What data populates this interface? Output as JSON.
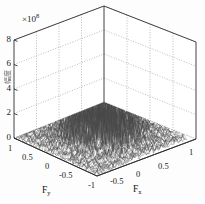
{
  "figure": {
    "kind": "3d-mesh-surface-plot",
    "background_color": "#fdfdfd",
    "mesh_color": "#3a3a3a",
    "grid_color": "#9a9a9a",
    "axis_color": "#2a2a2a",
    "exponent_prefix": "×10",
    "exponent_power": "8",
    "z_axis_title": "幅度"
  },
  "chart_data": {
    "type": "surface",
    "title": "",
    "xlabel": "F",
    "xlabel_sub": "x",
    "ylabel": "F",
    "ylabel_sub": "y",
    "zlabel": "",
    "xlim": [
      -1,
      1
    ],
    "ylim": [
      -1,
      1
    ],
    "zlim": [
      0,
      8
    ],
    "z_scale_multiplier": "×10^8",
    "grid": true,
    "legend": "none",
    "xticks": [
      -1,
      -0.5,
      0,
      0.5,
      1
    ],
    "xticklabels": [
      "-1",
      "-0.5",
      "0",
      "0.5",
      "1"
    ],
    "yticks": [
      -1,
      -0.5,
      0,
      0.5,
      1
    ],
    "yticklabels": [
      "-1",
      "-0.5",
      "0",
      "0.5",
      "1"
    ],
    "zticks": [
      0,
      2,
      4,
      6,
      8
    ],
    "zticklabels": [
      "0",
      "2",
      "4",
      "6",
      "8"
    ],
    "noise_floor": 0.25,
    "peak_value": 4.2,
    "peak_center": [
      0,
      0
    ]
  },
  "ticks": {
    "z": [
      "8",
      "6",
      "4",
      "2",
      "0"
    ],
    "y_left": [
      "1",
      "0.5",
      "0",
      "-0.5",
      "-1"
    ],
    "x_right": [
      "-0.5",
      "0",
      "0.5",
      "1"
    ]
  },
  "labels": {
    "x_axis": "F",
    "x_axis_sub": "x",
    "y_axis": "F",
    "y_axis_sub": "y"
  }
}
